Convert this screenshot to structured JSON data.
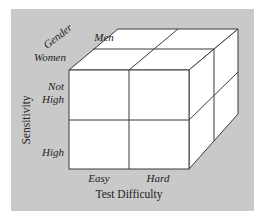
{
  "figure": {
    "background_color": "#c9c9c9",
    "face_color": "#ffffff",
    "edge_color": "#3a3a3a"
  },
  "axes": {
    "gender": {
      "title": "Gender",
      "levels": [
        "Women",
        "Men"
      ]
    },
    "sensitivity": {
      "title": "Sensitivity",
      "levels": [
        "Not High",
        "High"
      ],
      "level_lines": [
        [
          "Not",
          "High"
        ],
        [
          "High"
        ]
      ]
    },
    "test_difficulty": {
      "title": "Test Difficulty",
      "levels": [
        "Easy",
        "Hard"
      ]
    }
  }
}
